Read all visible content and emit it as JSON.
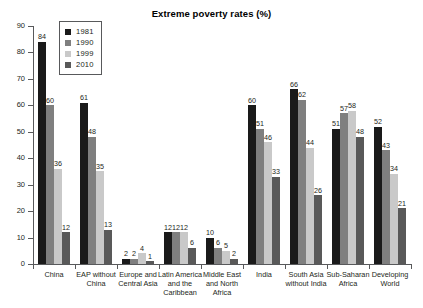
{
  "chart_data": {
    "type": "bar",
    "title": "Extreme poverty rates (%)",
    "xlabel": "",
    "ylabel": "",
    "ylim": [
      0,
      90
    ],
    "ytick_step": 10,
    "yticks": [
      "0",
      "10",
      "20",
      "30",
      "40",
      "50",
      "60",
      "70",
      "80",
      "90"
    ],
    "grid": false,
    "legend_position": "top-left-inside",
    "categories": [
      "China",
      "EAP without China",
      "Europe and Central Asia",
      "Latin America and the Caribbean",
      "Middle East and North Africa",
      "India",
      "South Asia without India",
      "Sub-Saharan Africa",
      "Developing World"
    ],
    "category_lines": [
      [
        "China"
      ],
      [
        "EAP without",
        "China"
      ],
      [
        "Europe and",
        "Central Asia"
      ],
      [
        "Latin America",
        "and the",
        "Caribbean"
      ],
      [
        "Middle East",
        "and North",
        "Africa"
      ],
      [
        "India"
      ],
      [
        "South Asia",
        "without India"
      ],
      [
        "Sub-Saharan",
        "Africa"
      ],
      [
        "Developing",
        "World"
      ]
    ],
    "series": [
      {
        "name": "1981",
        "color": "#1a1a1a",
        "values": [
          84,
          61,
          2,
          12,
          10,
          60,
          66,
          51,
          52
        ],
        "labels": [
          "84",
          "61",
          "2",
          "12",
          "10",
          "60",
          "66",
          "51",
          "52"
        ]
      },
      {
        "name": "1990",
        "color": "#7f7f7f",
        "values": [
          60,
          48,
          2,
          12,
          6,
          51,
          62,
          57,
          43
        ],
        "labels": [
          "60",
          "48",
          "2",
          "12",
          "6",
          "51",
          "62",
          "57",
          "43"
        ]
      },
      {
        "name": "1999",
        "color": "#c9c9c9",
        "values": [
          36,
          35,
          4,
          12,
          5,
          46,
          44,
          58,
          34
        ],
        "labels": [
          "36",
          "35",
          "4",
          "12",
          "5",
          "46",
          "44",
          "58",
          "34"
        ]
      },
      {
        "name": "2010",
        "color": "#595959",
        "values": [
          12,
          13,
          1,
          6,
          2,
          33,
          26,
          48,
          21
        ],
        "labels": [
          "12",
          "13",
          "1",
          "6",
          "2",
          "33",
          "26",
          "48",
          "21"
        ]
      }
    ]
  }
}
